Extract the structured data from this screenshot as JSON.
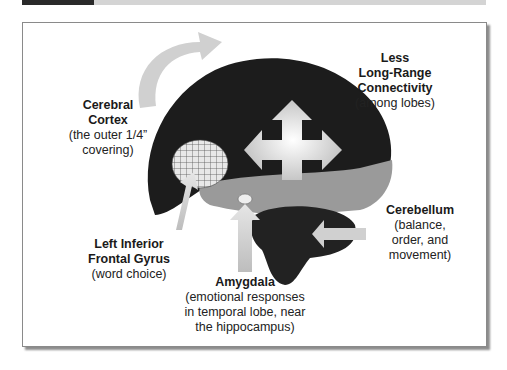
{
  "header": {
    "accent_color": "#2a2a2a",
    "bar_color": "#d4d4d4"
  },
  "figure": {
    "labels": {
      "cerebral_cortex": {
        "title_lines": [
          "Cerebral",
          "Cortex"
        ],
        "desc_lines": [
          "(the outer 1/4”",
          "covering)"
        ]
      },
      "connectivity": {
        "title_lines": [
          "Less",
          "Long-Range",
          "Connectivity"
        ],
        "desc_lines": [
          "(among lobes)"
        ]
      },
      "cerebellum": {
        "title_lines": [
          "Cerebellum"
        ],
        "desc_lines": [
          "(balance,",
          "order, and",
          "movement)"
        ]
      },
      "frontal_gyrus": {
        "title_lines": [
          "Left Inferior",
          "Frontal Gyrus"
        ],
        "desc_lines": [
          "(word choice)"
        ]
      },
      "amygdala": {
        "title_lines": [
          "Amygdala"
        ],
        "desc_lines": [
          "(emotional responses",
          "in temporal lobe, near",
          "the hippocampus)"
        ]
      }
    },
    "colors": {
      "cortex": "#1c1c1c",
      "temporal": "#9a9a9a",
      "arrow": "#d8d8d8",
      "cerebellum": "#222222"
    }
  }
}
